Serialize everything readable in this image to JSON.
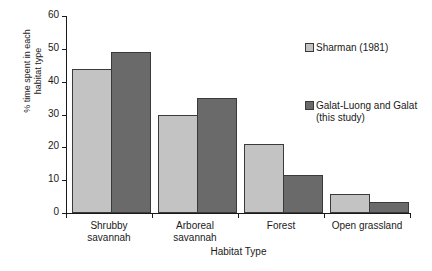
{
  "chart_data": {
    "type": "bar",
    "title": "",
    "xlabel": "Habitat Type",
    "ylabel": "% time spent in each\nhabitat type",
    "categories": [
      "Shrubby\nsavannah",
      "Arboreal\nsavannah",
      "Forest",
      "Open grassland"
    ],
    "series": [
      {
        "name": "Sharman (1981)",
        "values": [
          44,
          30,
          21,
          5.8
        ],
        "color": "#c3c3c3"
      },
      {
        "name": "Galat-Luong and Galat\n(this study)",
        "values": [
          49,
          35,
          11.7,
          3.4
        ],
        "color": "#6a6a6a"
      }
    ],
    "ylim": [
      0,
      60
    ],
    "yticks": [
      0,
      10,
      20,
      30,
      40,
      50,
      60
    ],
    "ytick_labels": [
      "0",
      "10",
      "20",
      "30",
      "40",
      "50",
      "60"
    ],
    "grid": false,
    "legend_position": "right"
  },
  "axis": {
    "y_title": "% time spent in each\nhabitat type",
    "x_title": "Habitat Type",
    "tick_60": "60",
    "tick_50": "50",
    "tick_40": "40",
    "tick_30": "30",
    "tick_20": "20",
    "tick_10": "10",
    "tick_0": "0"
  },
  "categories": {
    "c0": "Shrubby\nsavannah",
    "c1": "Arboreal\nsavannah",
    "c2": "Forest",
    "c3": "Open grassland"
  },
  "legend": {
    "item1": "Sharman (1981)",
    "item2": "Galat-Luong and Galat\n(this study)"
  }
}
